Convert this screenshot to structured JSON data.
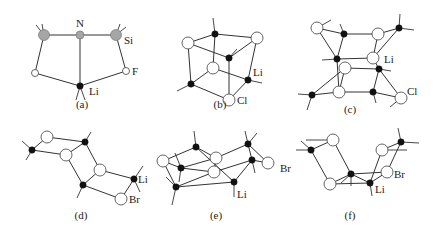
{
  "figure": {
    "panels": [
      {
        "id": "a",
        "caption": "(a)",
        "caption_pos": [
          82,
          108
        ],
        "atoms": [
          {
            "x": 44,
            "y": 35,
            "r": 5.5,
            "type": "gray"
          },
          {
            "x": 80,
            "y": 35,
            "r": 4,
            "type": "gray"
          },
          {
            "x": 116,
            "y": 35,
            "r": 5.5,
            "type": "gray"
          },
          {
            "x": 35,
            "y": 73,
            "r": 3.5,
            "type": "open"
          },
          {
            "x": 126,
            "y": 71,
            "r": 3.5,
            "type": "open"
          },
          {
            "x": 80,
            "y": 86,
            "r": 3.2,
            "type": "li"
          }
        ],
        "bonds": [
          [
            0,
            1
          ],
          [
            1,
            2
          ],
          [
            0,
            3
          ],
          [
            2,
            4
          ],
          [
            3,
            5
          ],
          [
            4,
            5
          ],
          [
            1,
            5
          ]
        ],
        "stubs": [
          [
            44,
            35,
            36,
            25
          ],
          [
            44,
            35,
            42,
            24
          ],
          [
            116,
            35,
            120,
            24
          ],
          [
            116,
            35,
            126,
            27
          ],
          [
            80,
            86,
            76,
            100
          ],
          [
            80,
            86,
            85,
            100
          ]
        ],
        "labels": [
          {
            "text": "N",
            "x": 76,
            "y": 27
          },
          {
            "text": "Si",
            "x": 124,
            "y": 44
          },
          {
            "text": "F",
            "x": 132,
            "y": 75
          },
          {
            "text": "Li",
            "x": 89,
            "y": 95
          }
        ]
      },
      {
        "id": "b",
        "caption": "(b)",
        "caption_pos": [
          220,
          108
        ],
        "atoms": [
          {
            "x": 188,
            "y": 43,
            "r": 6,
            "type": "open"
          },
          {
            "x": 215,
            "y": 34,
            "r": 3.2,
            "type": "li"
          },
          {
            "x": 257,
            "y": 38,
            "r": 6,
            "type": "open"
          },
          {
            "x": 229,
            "y": 58,
            "r": 3.2,
            "type": "li"
          },
          {
            "x": 213,
            "y": 68,
            "r": 6,
            "type": "open"
          },
          {
            "x": 191,
            "y": 84,
            "r": 3.2,
            "type": "li"
          },
          {
            "x": 248,
            "y": 80,
            "r": 3.2,
            "type": "li"
          },
          {
            "x": 229,
            "y": 100,
            "r": 6,
            "type": "open"
          }
        ],
        "bonds": [
          [
            0,
            1
          ],
          [
            1,
            2
          ],
          [
            0,
            3
          ],
          [
            2,
            3
          ],
          [
            0,
            5
          ],
          [
            1,
            4
          ],
          [
            2,
            6
          ],
          [
            3,
            7
          ],
          [
            4,
            5
          ],
          [
            4,
            6
          ],
          [
            5,
            7
          ],
          [
            6,
            7
          ]
        ],
        "stubs": [
          [
            215,
            34,
            213,
            18
          ],
          [
            229,
            58,
            237,
            49
          ],
          [
            191,
            84,
            177,
            91
          ],
          [
            248,
            80,
            262,
            83
          ]
        ],
        "labels": [
          {
            "text": "Li",
            "x": 253,
            "y": 76
          },
          {
            "text": "Cl",
            "x": 237,
            "y": 104
          }
        ]
      },
      {
        "id": "c",
        "caption": "(c)",
        "caption_pos": [
          350,
          113
        ],
        "atoms": [
          {
            "x": 317,
            "y": 28,
            "r": 6,
            "type": "open"
          },
          {
            "x": 344,
            "y": 34,
            "r": 3.2,
            "type": "li"
          },
          {
            "x": 378,
            "y": 34,
            "r": 6,
            "type": "open"
          },
          {
            "x": 399,
            "y": 28,
            "r": 3.2,
            "type": "li"
          },
          {
            "x": 337,
            "y": 59,
            "r": 3.2,
            "type": "li"
          },
          {
            "x": 373,
            "y": 58,
            "r": 6,
            "type": "open"
          },
          {
            "x": 345,
            "y": 68,
            "r": 6,
            "type": "open"
          },
          {
            "x": 379,
            "y": 69,
            "r": 3.2,
            "type": "li"
          },
          {
            "x": 312,
            "y": 95,
            "r": 3.2,
            "type": "li"
          },
          {
            "x": 339,
            "y": 92,
            "r": 6,
            "type": "open"
          },
          {
            "x": 373,
            "y": 92,
            "r": 3.2,
            "type": "li"
          },
          {
            "x": 401,
            "y": 98,
            "r": 6,
            "type": "open"
          }
        ],
        "bonds": [
          [
            0,
            1
          ],
          [
            1,
            2
          ],
          [
            2,
            3
          ],
          [
            0,
            4
          ],
          [
            1,
            4
          ],
          [
            2,
            5
          ],
          [
            3,
            5
          ],
          [
            4,
            5
          ],
          [
            4,
            9
          ],
          [
            6,
            7
          ],
          [
            6,
            8
          ],
          [
            5,
            7
          ],
          [
            7,
            10
          ],
          [
            7,
            11
          ],
          [
            8,
            9
          ],
          [
            9,
            10
          ],
          [
            10,
            11
          ],
          [
            6,
            9
          ]
        ],
        "stubs": [
          [
            317,
            28,
            331,
            20
          ],
          [
            344,
            34,
            340,
            24
          ],
          [
            399,
            28,
            400,
            14
          ],
          [
            399,
            28,
            414,
            30
          ],
          [
            337,
            59,
            322,
            60
          ],
          [
            379,
            69,
            391,
            71
          ],
          [
            312,
            95,
            298,
            94
          ],
          [
            312,
            95,
            307,
            110
          ],
          [
            373,
            92,
            376,
            103
          ],
          [
            401,
            98,
            390,
            107
          ]
        ],
        "labels": [
          {
            "text": "Li",
            "x": 384,
            "y": 63
          },
          {
            "text": "Cl",
            "x": 407,
            "y": 95
          }
        ]
      },
      {
        "id": "d",
        "caption": "(d)",
        "caption_pos": [
          81,
          219
        ],
        "atoms": [
          {
            "x": 47,
            "y": 137,
            "r": 6,
            "type": "open"
          },
          {
            "x": 85,
            "y": 142,
            "r": 3.2,
            "type": "li"
          },
          {
            "x": 32,
            "y": 150,
            "r": 3.2,
            "type": "li"
          },
          {
            "x": 66,
            "y": 155,
            "r": 6,
            "type": "open"
          },
          {
            "x": 100,
            "y": 170,
            "r": 6,
            "type": "open"
          },
          {
            "x": 134,
            "y": 179,
            "r": 3.2,
            "type": "li"
          },
          {
            "x": 83,
            "y": 185,
            "r": 3.2,
            "type": "li"
          },
          {
            "x": 121,
            "y": 199,
            "r": 6,
            "type": "open"
          }
        ],
        "bonds": [
          [
            0,
            1
          ],
          [
            0,
            2
          ],
          [
            2,
            3
          ],
          [
            1,
            3
          ],
          [
            1,
            4
          ],
          [
            3,
            6
          ],
          [
            4,
            5
          ],
          [
            4,
            6
          ],
          [
            6,
            7
          ],
          [
            5,
            7
          ]
        ],
        "stubs": [
          [
            85,
            142,
            91,
            132
          ],
          [
            32,
            150,
            22,
            141
          ],
          [
            32,
            150,
            26,
            160
          ],
          [
            134,
            179,
            143,
            166
          ],
          [
            134,
            179,
            140,
            192
          ],
          [
            83,
            185,
            77,
            198
          ]
        ],
        "labels": [
          {
            "text": "Li",
            "x": 138,
            "y": 183
          },
          {
            "text": "Br",
            "x": 129,
            "y": 203
          }
        ]
      },
      {
        "id": "e",
        "caption": "(e)",
        "caption_pos": [
          216,
          219
        ],
        "atoms": [
          {
            "x": 163,
            "y": 161,
            "r": 6,
            "type": "open"
          },
          {
            "x": 196,
            "y": 147,
            "r": 3.2,
            "type": "li"
          },
          {
            "x": 181,
            "y": 168,
            "r": 3.2,
            "type": "li"
          },
          {
            "x": 216,
            "y": 158,
            "r": 6,
            "type": "open"
          },
          {
            "x": 214,
            "y": 172,
            "r": 6,
            "type": "open"
          },
          {
            "x": 248,
            "y": 144,
            "r": 3.2,
            "type": "li"
          },
          {
            "x": 252,
            "y": 160,
            "r": 3.2,
            "type": "li"
          },
          {
            "x": 268,
            "y": 163,
            "r": 6,
            "type": "open"
          },
          {
            "x": 176,
            "y": 187,
            "r": 3.2,
            "type": "li"
          },
          {
            "x": 234,
            "y": 182,
            "r": 3.2,
            "type": "li"
          }
        ],
        "bonds": [
          [
            0,
            1
          ],
          [
            0,
            2
          ],
          [
            1,
            3
          ],
          [
            2,
            3
          ],
          [
            1,
            9
          ],
          [
            2,
            4
          ],
          [
            3,
            5
          ],
          [
            4,
            6
          ],
          [
            5,
            7
          ],
          [
            6,
            7
          ],
          [
            0,
            8
          ],
          [
            8,
            4
          ],
          [
            8,
            9
          ],
          [
            9,
            6
          ],
          [
            5,
            6
          ],
          [
            4,
            3
          ]
        ],
        "stubs": [
          [
            196,
            147,
            194,
            131
          ],
          [
            181,
            168,
            175,
            153
          ],
          [
            181,
            168,
            179,
            182
          ],
          [
            248,
            144,
            245,
            131
          ],
          [
            248,
            144,
            257,
            133
          ],
          [
            252,
            160,
            255,
            173
          ],
          [
            176,
            187,
            166,
            177
          ],
          [
            176,
            187,
            172,
            205
          ],
          [
            234,
            182,
            234,
            197
          ]
        ],
        "labels": [
          {
            "text": "Br",
            "x": 280,
            "y": 172
          },
          {
            "text": "Li",
            "x": 237,
            "y": 198
          }
        ]
      },
      {
        "id": "f",
        "caption": "(f)",
        "caption_pos": [
          350,
          219
        ],
        "atoms": [
          {
            "x": 333,
            "y": 140,
            "r": 6,
            "type": "open"
          },
          {
            "x": 311,
            "y": 150,
            "r": 3.2,
            "type": "li"
          },
          {
            "x": 330,
            "y": 184,
            "r": 6,
            "type": "open"
          },
          {
            "x": 351,
            "y": 174,
            "r": 3.2,
            "type": "li"
          },
          {
            "x": 382,
            "y": 150,
            "r": 6,
            "type": "open"
          },
          {
            "x": 401,
            "y": 142,
            "r": 3.2,
            "type": "li"
          },
          {
            "x": 387,
            "y": 172,
            "r": 6,
            "type": "open"
          },
          {
            "x": 370,
            "y": 183,
            "r": 3.2,
            "type": "li"
          }
        ],
        "bonds": [
          [
            0,
            1
          ],
          [
            1,
            2
          ],
          [
            0,
            3
          ],
          [
            2,
            3
          ],
          [
            2,
            7
          ],
          [
            3,
            6
          ],
          [
            4,
            5
          ],
          [
            4,
            7
          ],
          [
            5,
            6
          ],
          [
            6,
            7
          ],
          [
            3,
            7
          ]
        ],
        "stubs": [
          [
            311,
            150,
            296,
            150
          ],
          [
            311,
            150,
            301,
            141
          ],
          [
            333,
            140,
            306,
            140
          ],
          [
            351,
            174,
            351,
            186
          ],
          [
            351,
            174,
            341,
            183
          ],
          [
            401,
            142,
            398,
            128
          ],
          [
            401,
            142,
            419,
            143
          ],
          [
            382,
            150,
            407,
            150
          ],
          [
            370,
            183,
            372,
            196
          ]
        ],
        "labels": [
          {
            "text": "Br",
            "x": 394,
            "y": 178
          },
          {
            "text": "Li",
            "x": 375,
            "y": 193
          }
        ]
      }
    ]
  }
}
